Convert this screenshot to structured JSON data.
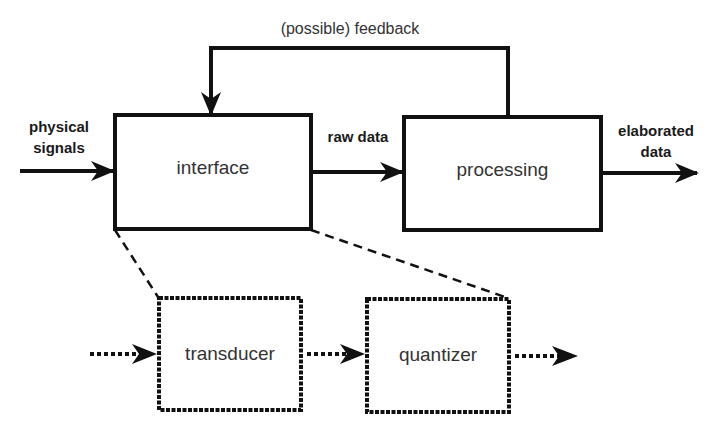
{
  "diagram": {
    "title_feedback": "(possible) feedback",
    "blocks": {
      "interface": "interface",
      "processing": "processing",
      "transducer": "transducer",
      "quantizer": "quantizer"
    },
    "flows": {
      "input_line1": "physical",
      "input_line2": "signals",
      "middle": "raw data",
      "output_line1": "elaborated",
      "output_line2": "data"
    },
    "colors": {
      "stroke": "#111111",
      "text": "#333333",
      "background": "#ffffff"
    }
  }
}
